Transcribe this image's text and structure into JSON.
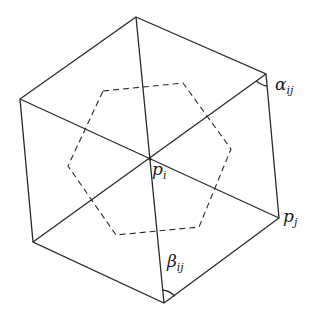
{
  "diagram": {
    "title": "",
    "colors": {
      "stroke": "#2a2a2a",
      "background": "#ffffff"
    },
    "outer_hexagon": [
      [
        136,
        17
      ],
      [
        266,
        74
      ],
      [
        279,
        218
      ],
      [
        164,
        303
      ],
      [
        33,
        242
      ],
      [
        20,
        99
      ]
    ],
    "center": [
      150,
      159
    ],
    "dashed_hexagon": [
      [
        103,
        91
      ],
      [
        183,
        83
      ],
      [
        231,
        149
      ],
      [
        199,
        227
      ],
      [
        116,
        235
      ],
      [
        68,
        166
      ]
    ],
    "labels": {
      "alpha": {
        "base": "α",
        "sub": "ij"
      },
      "beta": {
        "base": "β",
        "sub": "ij"
      },
      "pi": {
        "base": "p",
        "sub": "i"
      },
      "pj": {
        "base": "p",
        "sub": "j"
      }
    }
  }
}
